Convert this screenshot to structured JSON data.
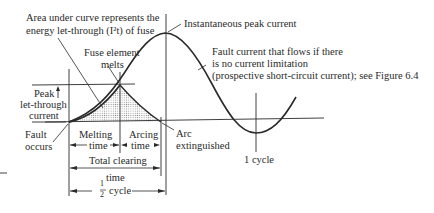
{
  "figure": {
    "labels": {
      "area_line1": "Area under curve represents the",
      "area_line2": "energy let-through (I²t) of fuse",
      "fuse_melts_line1": "Fuse element",
      "fuse_melts_line2": "melts",
      "peak_current": "Instantaneous peak current",
      "prospective_line1": "Fault current that flows if there",
      "prospective_line2": "is no current limitation",
      "prospective_line3": "(prospective short-circuit current); see Figure 6.4",
      "peak_letthrough_line1": "Peak",
      "peak_letthrough_line2": "let-through",
      "peak_letthrough_line3": "current",
      "fault_occurs_line1": "Fault",
      "fault_occurs_line2": "occurs",
      "melting_time_line1": "Melting",
      "melting_time_line2": "time",
      "arcing_time_line1": "Arcing",
      "arcing_time_line2": "time",
      "arc_extinguished_line1": "Arc",
      "arc_extinguished_line2": "extinguished",
      "total_clearing_line1": "Total clearing",
      "total_clearing_line2": "time",
      "half_cycle_num": "1",
      "half_cycle_den": "2",
      "half_cycle_word": "cycle",
      "one_cycle": "1 cycle"
    },
    "colors": {
      "ink": "#2a2a2a",
      "shading": "#9a9a9a",
      "background": "#ffffff"
    }
  }
}
